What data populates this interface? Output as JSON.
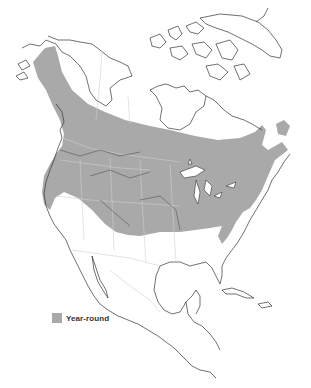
{
  "map": {
    "region": "North America",
    "range_fill_color": "#a9a9a9",
    "coastline_color": "#333333",
    "border_color": "#cfcfcf"
  },
  "legend": {
    "items": [
      {
        "label": "Year-round",
        "color": "#a9a9a9"
      }
    ]
  }
}
